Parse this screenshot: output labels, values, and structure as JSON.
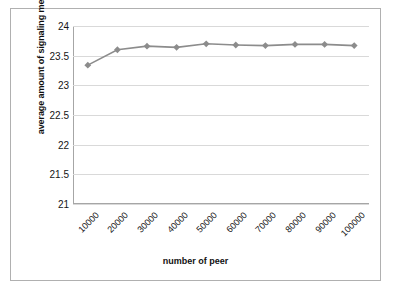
{
  "chart_data": {
    "type": "line",
    "title": "",
    "xlabel": "number of peer",
    "ylabel": "average amount of signaling messages",
    "categories": [
      "10000",
      "20000",
      "30000",
      "40000",
      "50000",
      "60000",
      "70000",
      "80000",
      "90000",
      "100000"
    ],
    "values": [
      23.34,
      23.6,
      23.66,
      23.64,
      23.7,
      23.68,
      23.67,
      23.69,
      23.69,
      23.67
    ],
    "series": [
      {
        "name": "average amount of signaling messages",
        "values": [
          23.34,
          23.6,
          23.66,
          23.64,
          23.7,
          23.68,
          23.67,
          23.69,
          23.69,
          23.67
        ]
      }
    ],
    "ylim": [
      21,
      24
    ],
    "ytick_labels": [
      "21",
      "21.5",
      "22",
      "22.5",
      "23",
      "23.5",
      "24"
    ],
    "ytick_values": [
      21,
      21.5,
      22,
      22.5,
      23,
      23.5,
      24
    ],
    "grid": true,
    "grid_axis": "y",
    "legend": false,
    "legend_position": "none",
    "marker": "diamond",
    "series_color": "#8c8c8c",
    "grid_color": "#d9d9d9",
    "axis_color": "#a6a6a6",
    "background_color": "#ffffff",
    "xtick_rotation": -45
  }
}
